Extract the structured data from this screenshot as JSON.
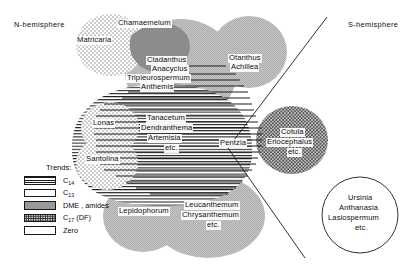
{
  "figure": {
    "type": "venn-distribution-diagram",
    "hemisphere_labels": {
      "north": "N-hemisphere",
      "south": "S-hemisphere"
    }
  },
  "legend": {
    "title": "Trends:",
    "items": [
      {
        "swatch": "horizontal-lines",
        "label_main": "C",
        "label_sub": "14",
        "label_suffix": "",
        "key": "c14"
      },
      {
        "swatch": "blank-white",
        "label_main": "C",
        "label_sub": "13",
        "label_suffix": "",
        "key": "c13"
      },
      {
        "swatch": "solid-grey",
        "label_main": "DME , amides",
        "label_sub": "",
        "label_suffix": "",
        "key": "dme"
      },
      {
        "swatch": "dotted-stipple",
        "label_main": "C",
        "label_sub": "17",
        "label_suffix": " (DF)",
        "key": "c17"
      },
      {
        "swatch": "blank-outline",
        "label_main": "Zero",
        "label_sub": "",
        "label_suffix": "",
        "key": "zero"
      }
    ]
  },
  "groups": [
    {
      "id": "matricaria",
      "text": "Matricaria",
      "trend": "c17"
    },
    {
      "id": "chamaemelum",
      "text": "Chamaemelum",
      "trend": "dme"
    },
    {
      "id": "cladanthus",
      "text": "Cladanthus",
      "trend": "c13"
    },
    {
      "id": "anacyclus",
      "text": "Anacyclus",
      "trend": "c13"
    },
    {
      "id": "tripleurospermum",
      "text": "Tripleurospermum",
      "trend": "c13"
    },
    {
      "id": "anthemis",
      "text": "Anthemis",
      "trend": "c13"
    },
    {
      "id": "otanthus",
      "text": "Otanthus",
      "trend": "c13"
    },
    {
      "id": "achillea",
      "text": "Achillea",
      "trend": "c13"
    },
    {
      "id": "lonas",
      "text": "Lonas",
      "trend": "c17"
    },
    {
      "id": "santolina",
      "text": "Santolina",
      "trend": "c17"
    },
    {
      "id": "tanacetum",
      "text": "Tanacetum",
      "trend": "c14"
    },
    {
      "id": "dendranthema",
      "text": "Dendranthema",
      "trend": "c14"
    },
    {
      "id": "artemisia",
      "text": "Artemisia",
      "trend": "c14"
    },
    {
      "id": "artemisia_etc",
      "text": "etc.",
      "trend": "c14"
    },
    {
      "id": "pentzia",
      "text": "Pentzia",
      "trend": "c14"
    },
    {
      "id": "cotula",
      "text": "Cotula",
      "trend": "c17"
    },
    {
      "id": "eriocephalus",
      "text": "Eriocephalus",
      "trend": "c17"
    },
    {
      "id": "cotula_etc",
      "text": "etc.",
      "trend": "c17"
    },
    {
      "id": "lepidophorum",
      "text": "Lepidophorum",
      "trend": "c13"
    },
    {
      "id": "leucanthemum",
      "text": "Leucanthemum",
      "trend": "c13"
    },
    {
      "id": "chrysanthemum",
      "text": "Chrysanthemum",
      "trend": "c13"
    },
    {
      "id": "leuc_etc",
      "text": "etc.",
      "trend": "c13"
    },
    {
      "id": "ursinia",
      "text": "Ursinia",
      "trend": "zero"
    },
    {
      "id": "anthanasia",
      "text": "Anthanasia",
      "trend": "zero"
    },
    {
      "id": "lasiospermum",
      "text": "Lasiospermum",
      "trend": "zero"
    },
    {
      "id": "ursinia_etc",
      "text": "etc.",
      "trend": "zero"
    }
  ],
  "colors": {
    "outline": "#1a1a1a",
    "stipple_light": "#d4d4d4",
    "stipple_dark": "#a8a8a8",
    "grey_fill": "#b4b4b4",
    "dark_grey_fill": "#8e8e8e",
    "white": "#ffffff"
  }
}
